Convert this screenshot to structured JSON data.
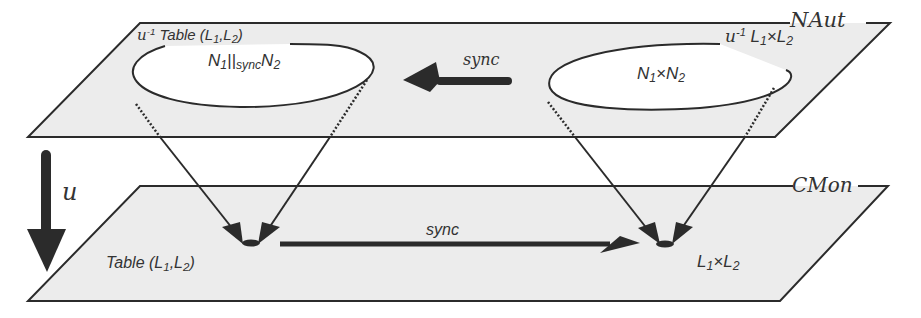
{
  "diagram": {
    "type": "layered-planes-mapping",
    "colors": {
      "plane_fill": "#ececec",
      "line": "#2b2b2b",
      "ellipse_fill": "#ffffff"
    },
    "upper_plane": {
      "name": "NAut",
      "left_region": {
        "label_prefix": "u",
        "label_sup": "-1",
        "label_text": " Table (L",
        "label_sub1": "1",
        "label_mid": ",L",
        "label_sub2": "2",
        "label_end": ")",
        "content_a": "N",
        "content_a_sub": "1",
        "content_op": "||",
        "content_op_sub": "sync",
        "content_b": "N",
        "content_b_sub": "2"
      },
      "right_region": {
        "label_prefix": "u",
        "label_sup": "-1",
        "label_a": " L",
        "label_a_sub": "1",
        "label_x": "×L",
        "label_b_sub": "2",
        "content_a": "N",
        "content_a_sub": "1",
        "content_x": "×N",
        "content_b_sub": "2"
      },
      "arrow_label": "sync"
    },
    "lower_plane": {
      "name": "CMon",
      "left_point": {
        "label_text": "Table (L",
        "label_sub1": "1",
        "label_mid": ",L",
        "label_sub2": "2",
        "label_end": ")"
      },
      "right_point": {
        "label_a": "L",
        "label_a_sub": "1",
        "label_x": "×L",
        "label_b_sub": "2"
      },
      "arrow_label": "sync"
    },
    "functor_label": "u"
  }
}
